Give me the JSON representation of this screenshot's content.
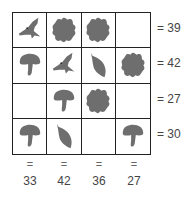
{
  "puzzle": {
    "icon_color": "#6e6e6e",
    "grid": [
      [
        "bird",
        "flower",
        "flower",
        ""
      ],
      [
        "mushroom",
        "bird",
        "leaf",
        "flower"
      ],
      [
        "",
        "mushroom",
        "flower",
        ""
      ],
      [
        "mushroom",
        "leaf",
        "",
        "mushroom"
      ]
    ],
    "row_sums": [
      "= 39",
      "= 42",
      "= 27",
      "= 30"
    ],
    "col_equals": [
      "=",
      "=",
      "=",
      "="
    ],
    "col_sums": [
      "33",
      "42",
      "36",
      "27"
    ]
  }
}
